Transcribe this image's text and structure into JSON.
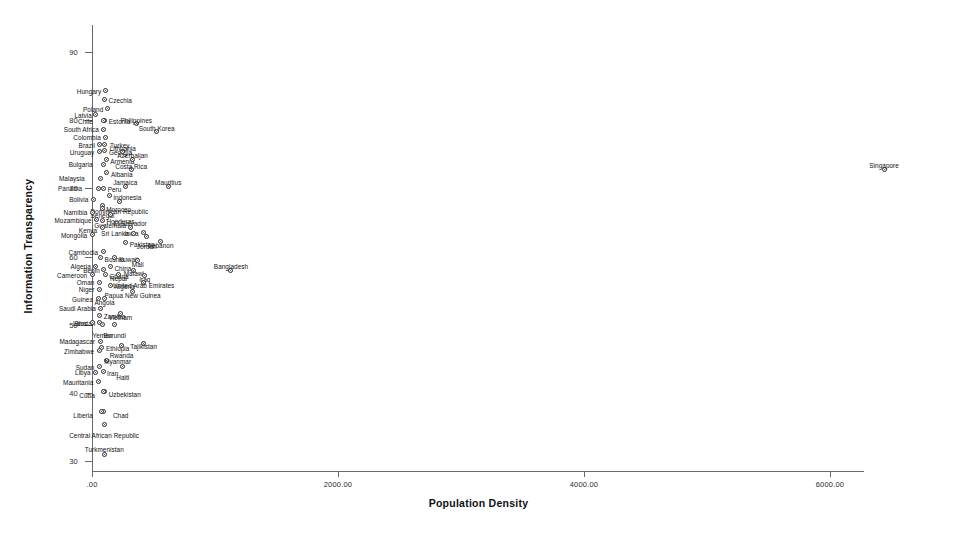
{
  "chart_data": {
    "type": "scatter",
    "title": "",
    "xlabel": "Population Density",
    "ylabel": "Information Transparency",
    "xlim": [
      -180,
      6820
    ],
    "ylim": [
      27.5,
      92.5
    ],
    "grid": false,
    "legend": "none",
    "xticks": [
      "'.00'",
      "2000.00",
      "4000.00",
      "6000.00"
    ],
    "xtick_values": [
      0,
      2000,
      4000,
      6000
    ],
    "xtick_labels": [
      ".00",
      "2000.00",
      "4000.00",
      "6000.00"
    ],
    "ytick_values": [
      30,
      40,
      50,
      60,
      70,
      80,
      90
    ],
    "ytick_labels": [
      "30",
      "40",
      "50",
      "60",
      "70",
      "80",
      "90"
    ],
    "point_label_field": "country",
    "points": [
      {
        "country": "Hungary",
        "x": 108,
        "y": 84.3,
        "lx": -4,
        "ly": 0,
        "pos": "rl"
      },
      {
        "country": "Czechia",
        "x": 102,
        "y": 83.0,
        "lx": 4,
        "ly": 0,
        "pos": "lr"
      },
      {
        "country": "Poland",
        "x": 124,
        "y": 81.7,
        "lx": -4,
        "ly": 0,
        "pos": "rl"
      },
      {
        "country": "Latvia",
        "x": 31,
        "y": 80.8,
        "lx": -4,
        "ly": 0,
        "pos": "rl"
      },
      {
        "country": "Estonia",
        "x": 104,
        "y": 79.9,
        "lx": 4,
        "ly": 0,
        "pos": "lr"
      },
      {
        "country": "Chile",
        "x": 96,
        "y": 79.9,
        "lx": -11,
        "ly": 0,
        "pos": "rl"
      },
      {
        "country": "Philippines",
        "x": 360,
        "y": 79.5,
        "lx": 0,
        "ly": -7,
        "pos": "ct"
      },
      {
        "country": "South Africa",
        "x": 97,
        "y": 78.7,
        "lx": -5,
        "ly": 0,
        "pos": "rl"
      },
      {
        "country": "South Korea",
        "x": 526,
        "y": 78.3,
        "lx": 0,
        "ly": -7,
        "pos": "ct"
      },
      {
        "country": "Colombia",
        "x": 112,
        "y": 77.5,
        "lx": -5,
        "ly": 0,
        "pos": "rl"
      },
      {
        "country": "Turkey",
        "x": 105,
        "y": 76.5,
        "lx": 5,
        "ly": 1,
        "pos": "lr"
      },
      {
        "country": "Brazil",
        "x": 64,
        "y": 76.4,
        "lx": -5,
        "ly": 0,
        "pos": "rl"
      },
      {
        "country": "Georgia",
        "x": 105,
        "y": 75.5,
        "lx": 4,
        "ly": 1,
        "pos": "lr"
      },
      {
        "country": "Uruguay",
        "x": 60,
        "y": 75.4,
        "lx": -5,
        "ly": 0,
        "pos": "rl"
      },
      {
        "country": "Lithuania",
        "x": 250,
        "y": 75.4,
        "lx": 0,
        "ly": -7,
        "pos": "ct"
      },
      {
        "country": "Armenia",
        "x": 115,
        "y": 74.2,
        "lx": 4,
        "ly": 1,
        "pos": "lr"
      },
      {
        "country": "Azerbaijan",
        "x": 330,
        "y": 74.3,
        "lx": 0,
        "ly": -7,
        "pos": "ct"
      },
      {
        "country": "Bulgaria",
        "x": 94,
        "y": 73.5,
        "lx": -11,
        "ly": 0,
        "pos": "rl"
      },
      {
        "country": "Costa Rica",
        "x": 318,
        "y": 72.7,
        "lx": 0,
        "ly": -7,
        "pos": "ct"
      },
      {
        "country": "Albania",
        "x": 121,
        "y": 72.3,
        "lx": 4,
        "ly": 1,
        "pos": "lr"
      },
      {
        "country": "Malaysia",
        "x": 70,
        "y": 71.5,
        "lx": -16,
        "ly": 0,
        "pos": "rl"
      },
      {
        "country": "Peru",
        "x": 95,
        "y": 70.0,
        "lx": 4,
        "ly": 1,
        "pos": "lr"
      },
      {
        "country": "Jamaica",
        "x": 270,
        "y": 70.3,
        "lx": 0,
        "ly": -7,
        "pos": "ct"
      },
      {
        "country": "Mauritius",
        "x": 620,
        "y": 70.3,
        "lx": 0,
        "ly": -7,
        "pos": "ct"
      },
      {
        "country": "Panama",
        "x": 50,
        "y": 70.0,
        "lx": -16,
        "ly": 0,
        "pos": "rl"
      },
      {
        "country": "Indonesia",
        "x": 140,
        "y": 68.9,
        "lx": 4,
        "ly": 1,
        "pos": "lr"
      },
      {
        "country": "Bolivia",
        "x": 11,
        "y": 68.4,
        "lx": -5,
        "ly": 0,
        "pos": "rl"
      },
      {
        "country": "Senegal",
        "x": 85,
        "y": 67.5,
        "lx": 0,
        "ly": 7,
        "pos": "ct"
      },
      {
        "country": "Dominican Republic",
        "x": 222,
        "y": 68.1,
        "lx": 0,
        "ly": 7,
        "pos": "ct"
      },
      {
        "country": "Morocco",
        "x": 83,
        "y": 67.1,
        "lx": 4,
        "ly": 1,
        "pos": "lr"
      },
      {
        "country": "Namibia",
        "x": 3,
        "y": 66.5,
        "lx": -5,
        "ly": 0,
        "pos": "rl"
      },
      {
        "country": "Guatemala",
        "x": 148,
        "y": 66.1,
        "lx": 0,
        "ly": 7,
        "pos": "ct"
      },
      {
        "country": "Mozambique",
        "x": 37,
        "y": 65.4,
        "lx": -5,
        "ly": 0,
        "pos": "rl"
      },
      {
        "country": "Honduras",
        "x": 85,
        "y": 65.3,
        "lx": 4,
        "ly": 1,
        "pos": "lr"
      },
      {
        "country": "Kenya",
        "x": 83,
        "y": 64.2,
        "lx": -5,
        "ly": 2,
        "pos": "rl"
      },
      {
        "country": "El Salvador",
        "x": 310,
        "y": 64.3,
        "lx": 0,
        "ly": -7,
        "pos": "ct"
      },
      {
        "country": "India",
        "x": 420,
        "y": 63.5,
        "lx": -5,
        "ly": 0,
        "pos": "rl"
      },
      {
        "country": "Sri Lanka",
        "x": 340,
        "y": 63.4,
        "lx": -5,
        "ly": 0,
        "pos": "rl"
      },
      {
        "country": "Mongolia",
        "x": 2,
        "y": 63.2,
        "lx": -5,
        "ly": 0,
        "pos": "rl"
      },
      {
        "country": "Jordan",
        "x": 445,
        "y": 63.0,
        "lx": 0,
        "ly": 7,
        "pos": "ct"
      },
      {
        "country": "Pakistan",
        "x": 275,
        "y": 62.0,
        "lx": 4,
        "ly": 1,
        "pos": "lr"
      },
      {
        "country": "Lebanon",
        "x": 560,
        "y": 62.2,
        "lx": 0,
        "ly": 0,
        "pos": "ct"
      },
      {
        "country": "Cambodia",
        "x": 90,
        "y": 60.7,
        "lx": -5,
        "ly": 0,
        "pos": "rl"
      },
      {
        "country": "Bosnia",
        "x": 70,
        "y": 59.8,
        "lx": 4,
        "ly": 1,
        "pos": "lr"
      },
      {
        "country": "Kuwait",
        "x": 186,
        "y": 59.8,
        "lx": 4,
        "ly": 1,
        "pos": "lr"
      },
      {
        "country": "Mali",
        "x": 372,
        "y": 59.4,
        "lx": 0,
        "ly": 0,
        "pos": "ct"
      },
      {
        "country": "Bangladesh",
        "x": 1130,
        "y": 57.9,
        "lx": 0,
        "ly": -8,
        "pos": "ct"
      },
      {
        "country": "Algeria",
        "x": 31,
        "y": 58.6,
        "lx": -5,
        "ly": 0,
        "pos": "rl"
      },
      {
        "country": "China",
        "x": 150,
        "y": 58.5,
        "lx": 4,
        "ly": 1,
        "pos": "lr"
      },
      {
        "country": "Benin",
        "x": 96,
        "y": 58.1,
        "lx": -4,
        "ly": 1,
        "pos": "rl"
      },
      {
        "country": "Malawi",
        "x": 340,
        "y": 58.0,
        "lx": 0,
        "ly": 0,
        "pos": "ct"
      },
      {
        "country": "Cameroon",
        "x": 2,
        "y": 57.3,
        "lx": -5,
        "ly": 0,
        "pos": "rl"
      },
      {
        "country": "Ghana",
        "x": 107,
        "y": 57.3,
        "lx": 4,
        "ly": 1,
        "pos": "lr"
      },
      {
        "country": "Nepal",
        "x": 216,
        "y": 57.3,
        "lx": 0,
        "ly": 0,
        "pos": "ct"
      },
      {
        "country": "Iraq",
        "x": 430,
        "y": 57.2,
        "lx": 0,
        "ly": 0,
        "pos": "ct"
      },
      {
        "country": "Oman",
        "x": 60,
        "y": 56.2,
        "lx": -5,
        "ly": 0,
        "pos": "rl"
      },
      {
        "country": "Nigeria",
        "x": 148,
        "y": 55.8,
        "lx": 4,
        "ly": 1,
        "pos": "lr"
      },
      {
        "country": "United Arab Emirates",
        "x": 420,
        "y": 56.2,
        "lx": 0,
        "ly": 0,
        "pos": "ct"
      },
      {
        "country": "Niger",
        "x": 60,
        "y": 55.2,
        "lx": -5,
        "ly": 0,
        "pos": "rl"
      },
      {
        "country": "Papua New Guinea",
        "x": 330,
        "y": 54.8,
        "lx": 0,
        "ly": 0,
        "pos": "ct"
      },
      {
        "country": "Guinea",
        "x": 49,
        "y": 53.8,
        "lx": -5,
        "ly": 0,
        "pos": "rl"
      },
      {
        "country": "Angola",
        "x": 102,
        "y": 53.8,
        "lx": 0,
        "ly": 0,
        "pos": "ct"
      },
      {
        "country": "Saudi Arabia",
        "x": 72,
        "y": 52.4,
        "lx": -5,
        "ly": 0,
        "pos": "rl"
      },
      {
        "country": "Zambia",
        "x": 63,
        "y": 51.4,
        "lx": 4,
        "ly": 1,
        "pos": "lr"
      },
      {
        "country": "Vietnam",
        "x": 230,
        "y": 51.6,
        "lx": 0,
        "ly": 0,
        "pos": "ct"
      },
      {
        "country": "Bhutan",
        "x": 60,
        "y": 50.3,
        "lx": -4,
        "ly": 0,
        "pos": "rl"
      },
      {
        "country": "Laos",
        "x": 0,
        "y": 50.3,
        "lx": -5,
        "ly": 0,
        "pos": "rl"
      },
      {
        "country": "Yemen",
        "x": 85,
        "y": 50.0,
        "lx": 0,
        "ly": 7,
        "pos": "ct"
      },
      {
        "country": "Burundi",
        "x": 185,
        "y": 50.0,
        "lx": 0,
        "ly": 7,
        "pos": "ct"
      },
      {
        "country": "Madagascar",
        "x": 66,
        "y": 47.6,
        "lx": -5,
        "ly": 0,
        "pos": "rl"
      },
      {
        "country": "Ethiopia",
        "x": 81,
        "y": 46.7,
        "lx": 4,
        "ly": 1,
        "pos": "lr"
      },
      {
        "country": "Rwanda",
        "x": 240,
        "y": 47.0,
        "lx": 0,
        "ly": 7,
        "pos": "ct"
      },
      {
        "country": "Tajikistan",
        "x": 420,
        "y": 47.3,
        "lx": 0,
        "ly": 0,
        "pos": "ct"
      },
      {
        "country": "Zimbabwe",
        "x": 57,
        "y": 46.2,
        "lx": -5,
        "ly": 0,
        "pos": "rl"
      },
      {
        "country": "Myanmar",
        "x": 115,
        "y": 44.7,
        "lx": -2,
        "ly": 0,
        "pos": "lr"
      },
      {
        "country": "Haiti",
        "x": 250,
        "y": 43.8,
        "lx": 0,
        "ly": 7,
        "pos": "ct"
      },
      {
        "country": "Sudan",
        "x": 60,
        "y": 43.8,
        "lx": -5,
        "ly": 0,
        "pos": "rl"
      },
      {
        "country": "Iran",
        "x": 90,
        "y": 43.1,
        "lx": 4,
        "ly": 1,
        "pos": "lr"
      },
      {
        "country": "Libya",
        "x": 29,
        "y": 43.0,
        "lx": -5,
        "ly": 0,
        "pos": "rl"
      },
      {
        "country": "Mauritania",
        "x": 52,
        "y": 41.6,
        "lx": -5,
        "ly": 0,
        "pos": "rl"
      },
      {
        "country": "Uzbekistan",
        "x": 103,
        "y": 40.2,
        "lx": 4,
        "ly": 3,
        "pos": "lr"
      },
      {
        "country": "Cuba",
        "x": 96,
        "y": 40.2,
        "lx": -9,
        "ly": 4,
        "pos": "rl"
      },
      {
        "country": "Chad",
        "x": 97,
        "y": 37.3,
        "lx": 9,
        "ly": 4,
        "pos": "lr"
      },
      {
        "country": "Liberia",
        "x": 80,
        "y": 37.3,
        "lx": -9,
        "ly": 4,
        "pos": "rl"
      },
      {
        "country": "Central African Republic",
        "x": 98,
        "y": 35.3,
        "lx": 0,
        "ly": 7,
        "pos": "ct"
      },
      {
        "country": "Turkmenistan",
        "x": 100,
        "y": 31.0,
        "lx": 0,
        "ly": -8,
        "pos": "ct"
      },
      {
        "country": "Singapore",
        "x": 6440,
        "y": 72.7,
        "lx": 0,
        "ly": -8,
        "pos": "ct"
      }
    ]
  }
}
